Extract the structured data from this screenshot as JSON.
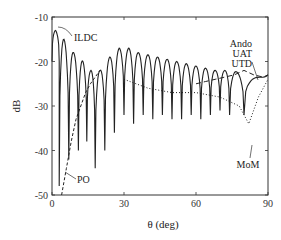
{
  "chart_data": {
    "type": "line",
    "title": "",
    "xlabel": "θ (deg)",
    "ylabel": "dB",
    "xlim": [
      0,
      90
    ],
    "ylim": [
      -50,
      -10
    ],
    "xticks": [
      0,
      30,
      60,
      90
    ],
    "yticks": [
      -10,
      -20,
      -30,
      -40,
      -50
    ],
    "grid": false,
    "legend": "inline annotations",
    "annotations": [
      {
        "text": "ILDC",
        "x": 2,
        "y": -13
      },
      {
        "text": "PO",
        "x": 8,
        "y": -45
      },
      {
        "text": "Ando",
        "x": 84,
        "y": -19
      },
      {
        "text": "UAT",
        "x": 84,
        "y": -21
      },
      {
        "text": "UTD",
        "x": 84,
        "y": -23
      },
      {
        "text": "MoM",
        "x": 80,
        "y": -35
      }
    ],
    "series": [
      {
        "name": "ILDC / MoM / UAT / UTD (solid, oscillating envelope)",
        "style": "solid",
        "peak_envelope": {
          "x": [
            1.5,
            5,
            9,
            13,
            16,
            20,
            24,
            28,
            32,
            36,
            40,
            44,
            48,
            52,
            56,
            60,
            64,
            68,
            72,
            76,
            82,
            90
          ],
          "y": [
            -13,
            -15,
            -18,
            -20,
            -22,
            -22,
            -19,
            -17,
            -17,
            -18,
            -18.5,
            -19,
            -19.5,
            -20,
            -20.5,
            -21,
            -21.5,
            -22,
            -22,
            -22,
            -24,
            -23
          ]
        },
        "nulls": {
          "x": [
            3,
            7,
            11,
            14.5,
            18,
            22,
            26,
            30,
            34,
            38,
            42,
            46,
            50,
            54,
            58,
            62,
            66,
            70,
            74,
            80
          ],
          "y": [
            -48,
            -42,
            -40,
            -38,
            -44,
            -40,
            -36,
            -32,
            -34,
            -32,
            -33,
            -32,
            -33,
            -33,
            -32,
            -33,
            -32,
            -31,
            -32,
            -32
          ]
        }
      },
      {
        "name": "PO",
        "style": "dashed",
        "x": [
          4,
          6,
          8,
          10,
          12,
          14,
          16,
          18,
          20
        ],
        "y": [
          -50,
          -44,
          -38,
          -33,
          -30,
          -27,
          -25,
          -23.5,
          -22
        ]
      },
      {
        "name": "Ando",
        "style": "dashed-long",
        "x": [
          60,
          64,
          68,
          72,
          76,
          80,
          84,
          88,
          90
        ],
        "y": [
          -25,
          -24.5,
          -24,
          -23.5,
          -23,
          -22,
          -23,
          -23.5,
          -23
        ]
      },
      {
        "name": "MoM (dotted)",
        "style": "dotted",
        "x": [
          30,
          40,
          50,
          60,
          70,
          78,
          82,
          86,
          90
        ],
        "y": [
          -24,
          -26,
          -27,
          -27,
          -28,
          -30,
          -34,
          -28,
          -24
        ]
      }
    ]
  },
  "axes": {
    "x_tick_labels": [
      "0",
      "30",
      "60",
      "90"
    ],
    "y_tick_labels": [
      "-10",
      "-20",
      "-30",
      "-40",
      "-50"
    ],
    "xlabel": "θ (deg)",
    "ylabel": "dB"
  },
  "labels": {
    "ildc": "ILDC",
    "po": "PO",
    "ando": "Ando",
    "uat": "UAT",
    "utd": "UTD",
    "mom": "MoM"
  }
}
